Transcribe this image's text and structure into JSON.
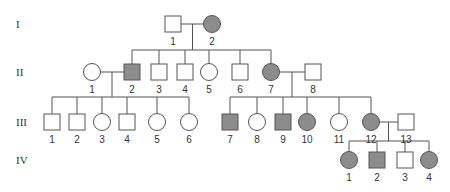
{
  "figure": {
    "type": "pedigree",
    "colors": {
      "affected": "#8c8c8c",
      "unaffected": "#ffffff",
      "line": "#555555"
    },
    "generations": [
      {
        "label": "I",
        "y": 24
      },
      {
        "label": "II",
        "y": 72
      },
      {
        "label": "III",
        "y": 122
      },
      {
        "label": "IV",
        "y": 160
      }
    ],
    "individuals": [
      {
        "id": "I-1",
        "gen": 0,
        "num": "1",
        "sex": "male",
        "affected": false,
        "x": 173
      },
      {
        "id": "I-2",
        "gen": 0,
        "num": "2",
        "sex": "female",
        "affected": true,
        "x": 212
      },
      {
        "id": "II-1",
        "gen": 1,
        "num": "1",
        "sex": "female",
        "affected": false,
        "x": 92
      },
      {
        "id": "II-2",
        "gen": 1,
        "num": "2",
        "sex": "male",
        "affected": true,
        "x": 132
      },
      {
        "id": "II-3",
        "gen": 1,
        "num": "3",
        "sex": "male",
        "affected": false,
        "x": 159
      },
      {
        "id": "II-4",
        "gen": 1,
        "num": "4",
        "sex": "male",
        "affected": false,
        "x": 185
      },
      {
        "id": "II-5",
        "gen": 1,
        "num": "5",
        "sex": "female",
        "affected": false,
        "x": 209
      },
      {
        "id": "II-6",
        "gen": 1,
        "num": "6",
        "sex": "male",
        "affected": false,
        "x": 240
      },
      {
        "id": "II-7",
        "gen": 1,
        "num": "7",
        "sex": "female",
        "affected": true,
        "x": 271
      },
      {
        "id": "II-8",
        "gen": 1,
        "num": "8",
        "sex": "male",
        "affected": false,
        "x": 313
      },
      {
        "id": "III-1",
        "gen": 2,
        "num": "1",
        "sex": "male",
        "affected": false,
        "x": 52
      },
      {
        "id": "III-2",
        "gen": 2,
        "num": "2",
        "sex": "male",
        "affected": false,
        "x": 77
      },
      {
        "id": "III-3",
        "gen": 2,
        "num": "3",
        "sex": "female",
        "affected": false,
        "x": 102
      },
      {
        "id": "III-4",
        "gen": 2,
        "num": "4",
        "sex": "male",
        "affected": false,
        "x": 127
      },
      {
        "id": "III-5",
        "gen": 2,
        "num": "5",
        "sex": "female",
        "affected": false,
        "x": 157
      },
      {
        "id": "III-6",
        "gen": 2,
        "num": "6",
        "sex": "female",
        "affected": false,
        "x": 189
      },
      {
        "id": "III-7",
        "gen": 2,
        "num": "7",
        "sex": "male",
        "affected": true,
        "x": 230
      },
      {
        "id": "III-8",
        "gen": 2,
        "num": "8",
        "sex": "female",
        "affected": false,
        "x": 257
      },
      {
        "id": "III-9",
        "gen": 2,
        "num": "9",
        "sex": "male",
        "affected": true,
        "x": 283
      },
      {
        "id": "III-10",
        "gen": 2,
        "num": "10",
        "sex": "female",
        "affected": true,
        "x": 307
      },
      {
        "id": "III-11",
        "gen": 2,
        "num": "11",
        "sex": "female",
        "affected": false,
        "x": 339
      },
      {
        "id": "III-12",
        "gen": 2,
        "num": "12",
        "sex": "female",
        "affected": true,
        "x": 371
      },
      {
        "id": "III-13",
        "gen": 2,
        "num": "13",
        "sex": "male",
        "affected": false,
        "x": 406
      },
      {
        "id": "IV-1",
        "gen": 3,
        "num": "1",
        "sex": "female",
        "affected": true,
        "x": 349
      },
      {
        "id": "IV-2",
        "gen": 3,
        "num": "2",
        "sex": "male",
        "affected": true,
        "x": 377
      },
      {
        "id": "IV-3",
        "gen": 3,
        "num": "3",
        "sex": "male",
        "affected": false,
        "x": 405
      },
      {
        "id": "IV-4",
        "gen": 3,
        "num": "4",
        "sex": "female",
        "affected": true,
        "x": 429
      }
    ],
    "matings": [
      {
        "a": "I-1",
        "b": "I-2",
        "children": [
          "II-2",
          "II-3",
          "II-4",
          "II-5",
          "II-6",
          "II-7"
        ]
      },
      {
        "a": "II-1",
        "b": "II-2",
        "children": [
          "III-1",
          "III-2",
          "III-3",
          "III-4",
          "III-5",
          "III-6"
        ]
      },
      {
        "a": "II-7",
        "b": "II-8",
        "children": [
          "III-7",
          "III-8",
          "III-9",
          "III-10",
          "III-11",
          "III-12"
        ]
      },
      {
        "a": "III-12",
        "b": "III-13",
        "children": [
          "IV-1",
          "IV-2",
          "IV-3",
          "IV-4"
        ]
      }
    ]
  }
}
